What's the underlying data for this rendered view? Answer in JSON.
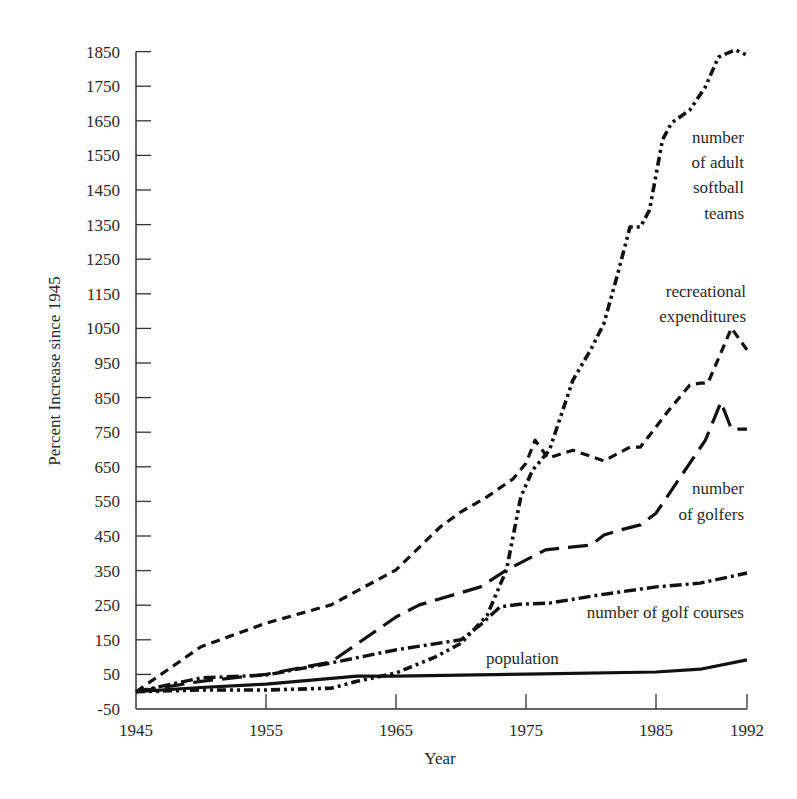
{
  "chart_data": {
    "type": "line",
    "title": "",
    "xlabel": "Year",
    "ylabel": "Percent Increase since 1945",
    "xlim": [
      1945,
      1992
    ],
    "ylim": [
      -50,
      1850
    ],
    "x_ticks": [
      1945,
      1955,
      1965,
      1975,
      1985,
      1992
    ],
    "y_ticks": [
      -50,
      50,
      150,
      250,
      350,
      450,
      550,
      650,
      750,
      850,
      950,
      1050,
      1150,
      1250,
      1350,
      1450,
      1550,
      1650,
      1750,
      1850
    ],
    "grid": false,
    "legend": "inline labels",
    "series": [
      {
        "name": "number of adult softball teams",
        "label_lines": [
          "number",
          "of adult",
          "softball",
          "teams"
        ],
        "style": "dash-dot-dot",
        "x": [
          1945,
          1950,
          1955,
          1960,
          1962,
          1965,
          1968,
          1970,
          1972,
          1973.5,
          1974.6,
          1975.5,
          1976.8,
          1978.6,
          1980,
          1981,
          1982,
          1983,
          1983.8,
          1984.5,
          1985.5,
          1986.2,
          1987.6,
          1988.8,
          1989.8,
          1991.1,
          1992
        ],
        "y": [
          0,
          5,
          5,
          10,
          30,
          54,
          100,
          140,
          220,
          352,
          563,
          640,
          698,
          900,
          990,
          1065,
          1200,
          1343,
          1343,
          1392,
          1595,
          1644,
          1681,
          1748,
          1834,
          1855,
          1840
        ]
      },
      {
        "name": "recreational expenditures",
        "label_lines": [
          "recreational",
          "expenditures"
        ],
        "style": "short-dash",
        "x": [
          1945,
          1950,
          1955,
          1960,
          1965,
          1968.4,
          1970,
          1972,
          1974,
          1975,
          1975.7,
          1976.7,
          1978.6,
          1981,
          1983,
          1983.8,
          1986,
          1987.6,
          1988.4,
          1989,
          1990.8,
          1992
        ],
        "y": [
          0,
          130,
          198,
          251,
          352,
          476,
          520,
          563,
          615,
          660,
          727,
          675,
          698,
          667,
          707,
          707,
          814,
          886,
          892,
          892,
          1051,
          988
        ]
      },
      {
        "name": "number of golfers",
        "label_lines": [
          "number",
          "of golfers"
        ],
        "style": "long-dash",
        "x": [
          1945,
          1950,
          1955,
          1960,
          1965,
          1966.8,
          1971.5,
          1973.4,
          1976.5,
          1980,
          1981,
          1982.2,
          1983.8,
          1985,
          1988.8,
          1990,
          1990.8,
          1992
        ],
        "y": [
          0,
          30,
          50,
          86,
          216,
          251,
          303,
          349,
          410,
          424,
          453,
          467,
          482,
          516,
          727,
          837,
          759,
          759
        ]
      },
      {
        "name": "number of golf courses",
        "label_lines": [
          "number of golf courses"
        ],
        "style": "dash-dot",
        "x": [
          1945,
          1950,
          1955,
          1960,
          1965,
          1970,
          1971.5,
          1973,
          1974.5,
          1976.8,
          1980.7,
          1985,
          1988.4,
          1992
        ],
        "y": [
          0,
          40,
          48,
          83,
          121,
          150,
          193,
          245,
          253,
          256,
          280,
          303,
          314,
          343
        ]
      },
      {
        "name": "population",
        "label_lines": [
          "population"
        ],
        "style": "solid",
        "x": [
          1945,
          1950,
          1955,
          1962,
          1965,
          1975,
          1985,
          1988.4,
          1992
        ],
        "y": [
          0,
          12,
          22,
          45,
          45,
          51,
          57,
          65,
          92
        ]
      }
    ]
  }
}
